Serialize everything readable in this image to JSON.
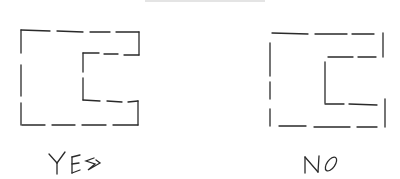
{
  "diagram": {
    "figures": [
      {
        "id": "yes",
        "label": "YES",
        "description": "Dashed C-shaped outline (closed)"
      },
      {
        "id": "no",
        "label": "NO",
        "description": "Dashed C-shaped outline with gaps (open)"
      }
    ],
    "stroke_color": "#2a2a2a",
    "background": "#ffffff"
  }
}
